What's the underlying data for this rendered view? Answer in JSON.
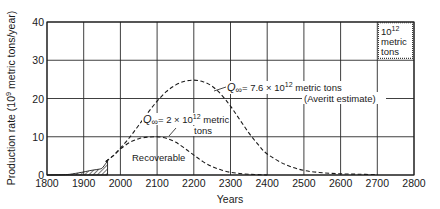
{
  "chart_data": {
    "type": "line",
    "title": "",
    "xlabel": "Years",
    "ylabel": "Production rate (10^9 metric tons/year)",
    "ylabel_parts": {
      "prefix": "Production rate (10",
      "sup": "9",
      "suffix": " metric tons/year)"
    },
    "xlim": [
      1800,
      2800
    ],
    "ylim": [
      0,
      40
    ],
    "grid": true,
    "x_ticks": [
      1800,
      1900,
      2000,
      2100,
      2200,
      2300,
      2400,
      2500,
      2600,
      2700,
      2800
    ],
    "y_ticks": [
      0,
      10,
      20,
      30,
      40
    ],
    "series": [
      {
        "name": "Q∞ = 7.6 × 10^12 metric tons (Averitt estimate)",
        "style": "dashed",
        "x": [
          1960,
          1980,
          2000,
          2025,
          2050,
          2075,
          2100,
          2125,
          2150,
          2175,
          2200,
          2225,
          2250,
          2275,
          2300,
          2325,
          2350,
          2375,
          2400,
          2450,
          2500,
          2550,
          2600,
          2650,
          2700
        ],
        "values": [
          3.5,
          5.0,
          7.0,
          9.8,
          13.0,
          16.3,
          19.3,
          21.8,
          23.5,
          24.5,
          24.8,
          24.4,
          23.2,
          21.0,
          18.0,
          14.5,
          11.0,
          8.0,
          5.5,
          2.7,
          1.2,
          0.6,
          0.3,
          0.2,
          0.1
        ]
      },
      {
        "name": "Q∞ = 2 × 10^12 metric tons",
        "style": "dashed",
        "x": [
          1960,
          1980,
          2000,
          2025,
          2050,
          2075,
          2100,
          2125,
          2150,
          2175,
          2200,
          2225,
          2250,
          2275,
          2300,
          2325,
          2350,
          2375,
          2400
        ],
        "values": [
          3.5,
          5.0,
          6.8,
          8.5,
          9.5,
          9.9,
          10.0,
          9.6,
          8.6,
          7.0,
          5.2,
          3.5,
          2.2,
          1.3,
          0.7,
          0.4,
          0.2,
          0.1,
          0.0
        ]
      },
      {
        "name": "Historical production (hatched)",
        "style": "hatched-area",
        "x": [
          1800,
          1850,
          1870,
          1900,
          1920,
          1940,
          1950,
          1960,
          1965
        ],
        "values": [
          0.0,
          0.1,
          0.3,
          0.8,
          1.2,
          1.5,
          1.8,
          3.0,
          3.7
        ]
      }
    ],
    "annotations": [
      {
        "id": "large",
        "text_main": "Q",
        "sub": "∞",
        "text_rest": "= 7.6 × 10",
        "sup": "12",
        "text_tail": " metric tons",
        "line2": "(Averitt estimate)"
      },
      {
        "id": "small",
        "text_main": "Q",
        "sub": "∞",
        "text_rest": "= 2 × 10",
        "sup": "12",
        "text_tail": " metric",
        "line2": "tons"
      },
      {
        "id": "recoverable",
        "text": "Recoverable"
      },
      {
        "id": "legend_box",
        "line1": "10",
        "sup": "12",
        "line2": "metric",
        "line3": "tons"
      }
    ]
  },
  "colors": {
    "ink": "#1a1a1a",
    "grid": "#2a2a2a",
    "background": "#ffffff"
  }
}
